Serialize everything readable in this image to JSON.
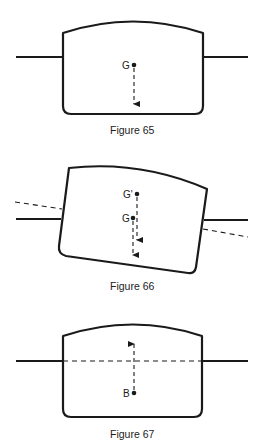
{
  "figures": [
    {
      "id": "fig65",
      "caption": "Figure 65",
      "points": [
        {
          "label": "G",
          "x": 134,
          "y": 65
        }
      ],
      "arrows": [
        {
          "direction": "down",
          "from_y": 65,
          "to_y": 106
        }
      ]
    },
    {
      "id": "fig66",
      "caption": "Figure 66",
      "points": [
        {
          "label": "G'",
          "x": 137,
          "y": 194
        },
        {
          "label": "G",
          "x": 133,
          "y": 218
        }
      ],
      "arrows": [
        {
          "direction": "down",
          "from_y": 194,
          "to_y": 242
        },
        {
          "direction": "down",
          "from_y": 218,
          "to_y": 257
        }
      ]
    },
    {
      "id": "fig67",
      "caption": "Figure 67",
      "points": [
        {
          "label": "B",
          "x": 133,
          "y": 393
        }
      ],
      "arrows": [
        {
          "direction": "up",
          "from_y": 393,
          "to_y": 342
        }
      ]
    }
  ],
  "colors": {
    "ink": "#1a1a1a",
    "background": "#ffffff"
  }
}
